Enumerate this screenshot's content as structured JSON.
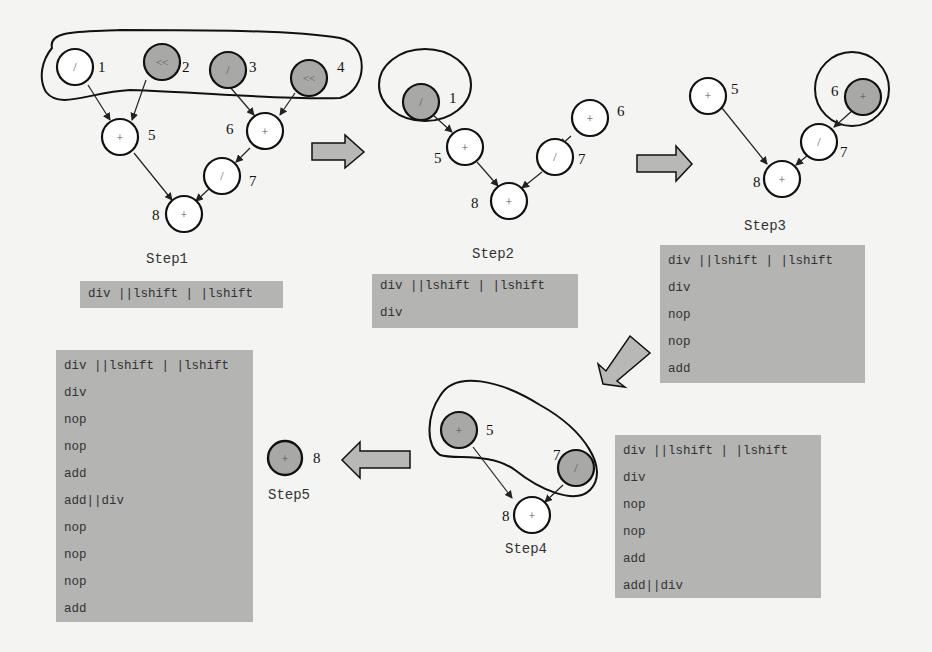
{
  "colors": {
    "background": "#f4f4f2",
    "node_fill_white": "#ffffff",
    "node_fill_gray": "#a8a8a6",
    "stroke": "#111111",
    "code_box_fill": "#b4b4b2",
    "arrow_fill": "#b8b8b6"
  },
  "steps": [
    {
      "label": "Step1",
      "nodes": [
        {
          "id": "1",
          "op": "/",
          "shaded": false
        },
        {
          "id": "2",
          "op": "<<",
          "shaded": true
        },
        {
          "id": "3",
          "op": "/",
          "shaded": true
        },
        {
          "id": "4",
          "op": "<<",
          "shaded": true
        },
        {
          "id": "5",
          "op": "+",
          "shaded": false
        },
        {
          "id": "6",
          "op": "+",
          "shaded": false
        },
        {
          "id": "7",
          "op": "/",
          "shaded": false
        },
        {
          "id": "8",
          "op": "+",
          "shaded": false
        }
      ],
      "code": [
        "div ||lshift | |lshift"
      ]
    },
    {
      "label": "Step2",
      "nodes": [
        {
          "id": "1",
          "op": "/",
          "shaded": true
        },
        {
          "id": "5",
          "op": "+",
          "shaded": false
        },
        {
          "id": "6",
          "op": "+",
          "shaded": false
        },
        {
          "id": "7",
          "op": "/",
          "shaded": false
        },
        {
          "id": "8",
          "op": "+",
          "shaded": false
        }
      ],
      "code": [
        "div ||lshift | |lshift",
        "div"
      ]
    },
    {
      "label": "Step3",
      "nodes": [
        {
          "id": "5",
          "op": "+",
          "shaded": false
        },
        {
          "id": "6",
          "op": "+",
          "shaded": true
        },
        {
          "id": "7",
          "op": "/",
          "shaded": false
        },
        {
          "id": "8",
          "op": "+",
          "shaded": false
        }
      ],
      "code": [
        "div ||lshift | |lshift",
        "div",
        "nop",
        "nop",
        "add"
      ]
    },
    {
      "label": "Step4",
      "nodes": [
        {
          "id": "5",
          "op": "+",
          "shaded": true
        },
        {
          "id": "7",
          "op": "/",
          "shaded": true
        },
        {
          "id": "8",
          "op": "+",
          "shaded": false
        }
      ],
      "code": [
        "div ||lshift | |lshift",
        "div",
        "nop",
        "nop",
        "add",
        "add||div"
      ]
    },
    {
      "label": "Step5",
      "nodes": [
        {
          "id": "8",
          "op": "+",
          "shaded": true
        }
      ],
      "code": [
        "div ||lshift | |lshift",
        "div",
        "nop",
        "nop",
        "add",
        "add||div",
        "nop",
        "nop",
        "nop",
        "add"
      ]
    }
  ]
}
